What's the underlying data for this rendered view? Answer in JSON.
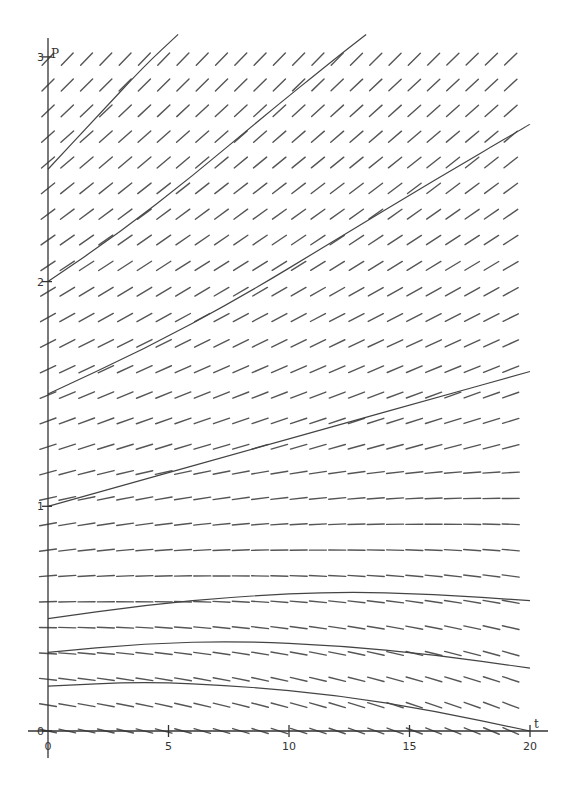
{
  "chart_data": {
    "type": "line",
    "subtype": "slope-field",
    "title": "",
    "xlabel": "t",
    "ylabel": "P",
    "xlim": [
      0,
      20
    ],
    "ylim": [
      0,
      3
    ],
    "x_ticks": [
      0,
      5,
      10,
      15,
      20
    ],
    "y_ticks": [
      0,
      1,
      2,
      3
    ],
    "x_tick_labels": [
      "0",
      "5",
      "10",
      "15",
      "20"
    ],
    "y_tick_labels": [
      "0",
      "1",
      "2",
      "3"
    ],
    "grid": false,
    "legend": null,
    "slope_field": {
      "columns": 25,
      "rows": 27,
      "t_step": 0.8,
      "p_step": 0.115,
      "equilibrium_approx": 0.5
    },
    "series": [
      {
        "name": "P(0)=2.5",
        "points": [
          [
            0,
            2.5
          ],
          [
            2,
            2.73
          ],
          [
            4,
            2.96
          ],
          [
            5.4,
            3.1
          ]
        ]
      },
      {
        "name": "P(0)=2.0",
        "points": [
          [
            0,
            2.0
          ],
          [
            3,
            2.22
          ],
          [
            6,
            2.47
          ],
          [
            9,
            2.74
          ],
          [
            12,
            3.0
          ],
          [
            13.2,
            3.1
          ]
        ]
      },
      {
        "name": "P(0)=1.5",
        "points": [
          [
            0,
            1.5
          ],
          [
            4,
            1.7
          ],
          [
            8,
            1.93
          ],
          [
            12,
            2.19
          ],
          [
            16,
            2.45
          ],
          [
            20,
            2.7
          ]
        ]
      },
      {
        "name": "P(0)=1.0",
        "points": [
          [
            0,
            1.0
          ],
          [
            4,
            1.12
          ],
          [
            8,
            1.24
          ],
          [
            12,
            1.36
          ],
          [
            16,
            1.48
          ],
          [
            20,
            1.6
          ]
        ]
      },
      {
        "name": "P(0)=0.5",
        "points": [
          [
            0,
            0.5
          ],
          [
            4,
            0.56
          ],
          [
            8,
            0.6
          ],
          [
            12,
            0.62
          ],
          [
            16,
            0.61
          ],
          [
            20,
            0.58
          ]
        ]
      },
      {
        "name": "P(0)=0.35",
        "points": [
          [
            0,
            0.35
          ],
          [
            4,
            0.39
          ],
          [
            8,
            0.4
          ],
          [
            12,
            0.38
          ],
          [
            16,
            0.34
          ],
          [
            20,
            0.28
          ]
        ]
      },
      {
        "name": "P(0)=0.2",
        "points": [
          [
            0,
            0.2
          ],
          [
            4,
            0.22
          ],
          [
            8,
            0.2
          ],
          [
            12,
            0.16
          ],
          [
            16,
            0.09
          ],
          [
            20,
            0.0
          ]
        ]
      }
    ]
  }
}
